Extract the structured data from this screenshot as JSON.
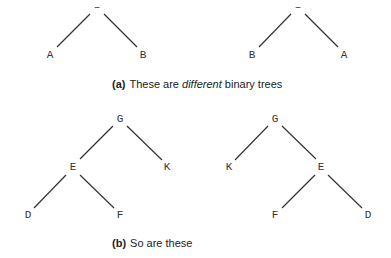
{
  "figure": {
    "part_a": {
      "caption_tag": "(a)",
      "caption_pre": "These are ",
      "caption_em": "different",
      "caption_post": " binary trees",
      "trees": [
        {
          "name": "tree-a-left",
          "nodes": [
            {
              "id": "root",
              "label": "–",
              "x": 97,
              "y": 7
            },
            {
              "id": "A",
              "label": "A",
              "x": 50,
              "y": 55
            },
            {
              "id": "B",
              "label": "B",
              "x": 143,
              "y": 55
            }
          ],
          "edges": [
            {
              "x1": 90,
              "y1": 14,
              "x2": 57,
              "y2": 47
            },
            {
              "x1": 104,
              "y1": 14,
              "x2": 137,
              "y2": 47
            }
          ]
        },
        {
          "name": "tree-a-right",
          "nodes": [
            {
              "id": "root",
              "label": "–",
              "x": 298,
              "y": 7
            },
            {
              "id": "B",
              "label": "B",
              "x": 252,
              "y": 55
            },
            {
              "id": "A",
              "label": "A",
              "x": 344,
              "y": 55
            }
          ],
          "edges": [
            {
              "x1": 291,
              "y1": 14,
              "x2": 259,
              "y2": 47
            },
            {
              "x1": 305,
              "y1": 14,
              "x2": 338,
              "y2": 47
            }
          ]
        }
      ]
    },
    "part_b": {
      "caption_tag": "(b)",
      "caption_text": "So are these",
      "trees": [
        {
          "name": "tree-b-left",
          "nodes": [
            {
              "id": "G",
              "label": "G",
              "x": 120,
              "y": 119
            },
            {
              "id": "E",
              "label": "E",
              "x": 73,
              "y": 167
            },
            {
              "id": "K",
              "label": "K",
              "x": 167,
              "y": 167
            },
            {
              "id": "D",
              "label": "D",
              "x": 28,
              "y": 215
            },
            {
              "id": "F",
              "label": "F",
              "x": 120,
              "y": 215
            }
          ],
          "edges": [
            {
              "x1": 113,
              "y1": 126,
              "x2": 80,
              "y2": 159
            },
            {
              "x1": 127,
              "y1": 126,
              "x2": 162,
              "y2": 160
            },
            {
              "x1": 66,
              "y1": 175,
              "x2": 34,
              "y2": 208
            },
            {
              "x1": 80,
              "y1": 175,
              "x2": 114,
              "y2": 208
            }
          ]
        },
        {
          "name": "tree-b-right",
          "nodes": [
            {
              "id": "G",
              "label": "G",
              "x": 275,
              "y": 119
            },
            {
              "id": "K",
              "label": "K",
              "x": 229,
              "y": 167
            },
            {
              "id": "E",
              "label": "E",
              "x": 321,
              "y": 167
            },
            {
              "id": "F",
              "label": "F",
              "x": 275,
              "y": 215
            },
            {
              "id": "D",
              "label": "D",
              "x": 368,
              "y": 215
            }
          ],
          "edges": [
            {
              "x1": 268,
              "y1": 126,
              "x2": 235,
              "y2": 160
            },
            {
              "x1": 282,
              "y1": 126,
              "x2": 316,
              "y2": 159
            },
            {
              "x1": 315,
              "y1": 175,
              "x2": 282,
              "y2": 208
            },
            {
              "x1": 328,
              "y1": 175,
              "x2": 362,
              "y2": 208
            }
          ]
        }
      ]
    }
  }
}
